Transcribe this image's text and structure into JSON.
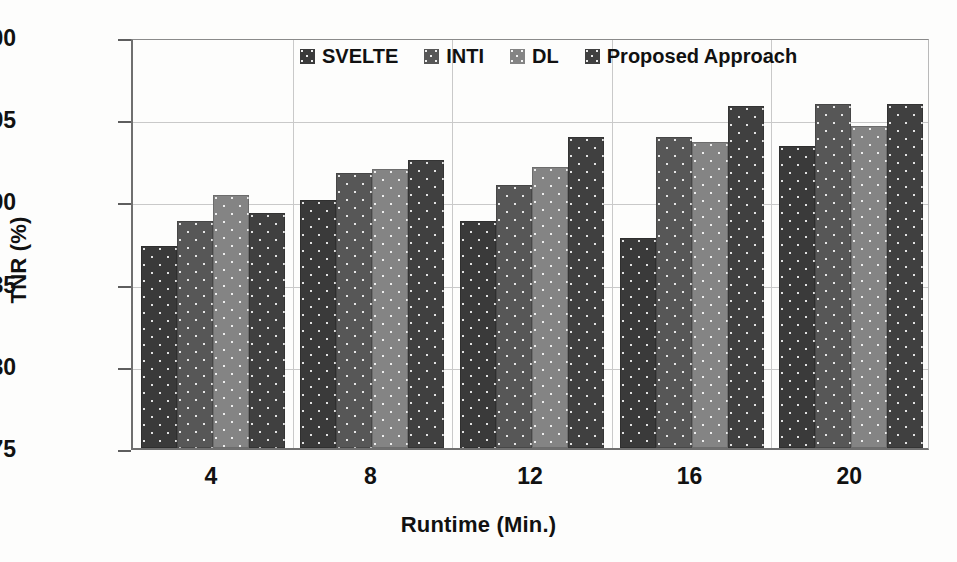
{
  "chart_data": {
    "type": "bar",
    "title": "",
    "subtitle": "",
    "xlabel": "Runtime (Min.)",
    "ylabel": "TNR (%)",
    "categories": [
      "4",
      "8",
      "12",
      "16",
      "20"
    ],
    "ylim": [
      75,
      100
    ],
    "yticks": [
      75,
      80,
      85,
      90,
      95,
      100
    ],
    "grid": true,
    "legend_position": "top-center",
    "series": [
      {
        "name": "SVELTE",
        "color": "#3a3a3a",
        "values": [
          87.3,
          90.1,
          88.8,
          87.8,
          93.4
        ]
      },
      {
        "name": "INTI",
        "color": "#575757",
        "values": [
          88.8,
          91.7,
          91.0,
          93.9,
          95.9
        ]
      },
      {
        "name": "DL",
        "color": "#848484",
        "values": [
          90.4,
          92.0,
          92.1,
          93.6,
          94.6
        ]
      },
      {
        "name": "Proposed Approach",
        "color": "#404040",
        "values": [
          89.3,
          92.5,
          93.9,
          95.8,
          95.9
        ]
      }
    ]
  },
  "axes": {
    "y_title": "TNR (%)",
    "x_title": "Runtime (Min.)",
    "y_tick_labels": [
      "100",
      "95",
      "90",
      "85",
      "80",
      "75"
    ],
    "x_tick_labels": [
      "4",
      "8",
      "12",
      "16",
      "20"
    ]
  },
  "legend": {
    "items": [
      {
        "label": "SVELTE"
      },
      {
        "label": "INTI"
      },
      {
        "label": "DL"
      },
      {
        "label": "Proposed Approach"
      }
    ]
  }
}
